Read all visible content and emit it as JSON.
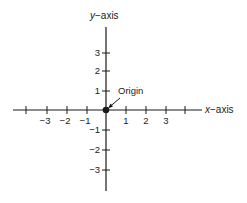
{
  "diagram": {
    "type": "cartesian-coordinate-axes",
    "origin_px": {
      "x": 106,
      "y": 110
    },
    "unit_px": 20,
    "x_axis": {
      "label_var": "x",
      "label_rest": "−axis",
      "range_px": [
        13,
        202
      ],
      "ticks": [
        {
          "value": -4,
          "label": ""
        },
        {
          "value": -3,
          "label": "−3"
        },
        {
          "value": -2,
          "label": "−2"
        },
        {
          "value": -1,
          "label": "−1"
        },
        {
          "value": 1,
          "label": "1"
        },
        {
          "value": 2,
          "label": "2"
        },
        {
          "value": 3,
          "label": "3"
        },
        {
          "value": 4,
          "label": ""
        }
      ]
    },
    "y_axis": {
      "label_var": "y",
      "label_rest": "−axis",
      "range_px": [
        27,
        191
      ],
      "ticks": [
        {
          "value": 3,
          "label": "3"
        },
        {
          "value": 2,
          "label": "2"
        },
        {
          "value": 1,
          "label": "1"
        },
        {
          "value": -1,
          "label": "−1"
        },
        {
          "value": -2,
          "label": "−2"
        },
        {
          "value": -3,
          "label": "−3"
        }
      ]
    },
    "origin": {
      "label": "Origin",
      "marker": "filled-dot"
    },
    "colors": {
      "ink": "#1a1a1a",
      "background": "#ffffff"
    }
  }
}
